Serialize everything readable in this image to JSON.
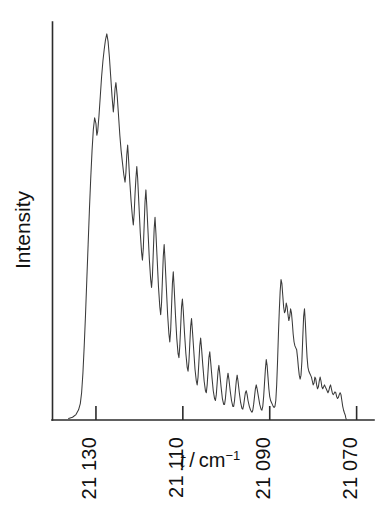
{
  "figure": {
    "background": "#ffffff",
    "trace_color": "#3a3a3a",
    "axis_color": "#2b2b2b"
  },
  "chart_data": {
    "type": "line",
    "title": "",
    "xlabel": "nu-tilde / cm^-1",
    "xlabel_parts": {
      "symbol": "ẽ",
      "separator": " / ",
      "unit": "cm",
      "exponent": "−1"
    },
    "ylabel": "Intensity",
    "xlim": [
      21140.0,
      21066.0
    ],
    "ylim": [
      0,
      100
    ],
    "x_inverted": true,
    "grid": false,
    "legend": null,
    "xticks": [
      21130,
      21110,
      21090,
      21070
    ],
    "xtick_labels": [
      "21 130",
      "21 110",
      "21 090",
      "21 070"
    ],
    "ytick_labels": [],
    "axis_note": "wavenumber decreases to the right; y-axis unlabeled arbitrary intensity",
    "series": [
      {
        "name": "LIF excitation spectrum",
        "color": "#3a3a3a",
        "points": [
          [
            21136.3,
            0.4
          ],
          [
            21135.4,
            0.7
          ],
          [
            21134.6,
            1.4
          ],
          [
            21134.0,
            2.6
          ],
          [
            21133.6,
            4.2
          ],
          [
            21133.3,
            7.0
          ],
          [
            21133.0,
            12.0
          ],
          [
            21132.7,
            19.0
          ],
          [
            21132.4,
            27.0
          ],
          [
            21132.1,
            36.0
          ],
          [
            21131.8,
            45.0
          ],
          [
            21131.5,
            54.0
          ],
          [
            21131.2,
            62.0
          ],
          [
            21130.9,
            69.0
          ],
          [
            21130.6,
            74.5
          ],
          [
            21130.3,
            77.5
          ],
          [
            21130.0,
            76.0
          ],
          [
            21129.8,
            73.0
          ],
          [
            21129.6,
            74.0
          ],
          [
            21129.3,
            78.0
          ],
          [
            21129.0,
            83.0
          ],
          [
            21128.7,
            88.0
          ],
          [
            21128.4,
            92.0
          ],
          [
            21128.1,
            95.0
          ],
          [
            21127.8,
            97.5
          ],
          [
            21127.5,
            99.0
          ],
          [
            21127.2,
            97.0
          ],
          [
            21126.9,
            93.0
          ],
          [
            21126.6,
            88.0
          ],
          [
            21126.3,
            83.0
          ],
          [
            21126.0,
            79.0
          ],
          [
            21125.8,
            81.5
          ],
          [
            21125.6,
            85.0
          ],
          [
            21125.4,
            86.5
          ],
          [
            21125.1,
            83.0
          ],
          [
            21124.8,
            78.0
          ],
          [
            21124.5,
            73.0
          ],
          [
            21124.2,
            69.0
          ],
          [
            21123.9,
            66.0
          ],
          [
            21123.6,
            63.0
          ],
          [
            21123.3,
            61.0
          ],
          [
            21123.1,
            63.5
          ],
          [
            21122.9,
            68.0
          ],
          [
            21122.7,
            70.5
          ],
          [
            21122.5,
            67.0
          ],
          [
            21122.2,
            61.0
          ],
          [
            21121.9,
            56.0
          ],
          [
            21121.6,
            52.0
          ],
          [
            21121.4,
            50.0
          ],
          [
            21121.2,
            53.0
          ],
          [
            21121.0,
            58.0
          ],
          [
            21120.8,
            62.0
          ],
          [
            21120.6,
            65.0
          ],
          [
            21120.4,
            62.0
          ],
          [
            21120.1,
            55.0
          ],
          [
            21119.8,
            48.0
          ],
          [
            21119.5,
            43.0
          ],
          [
            21119.3,
            41.0
          ],
          [
            21119.1,
            44.0
          ],
          [
            21118.9,
            50.0
          ],
          [
            21118.7,
            56.0
          ],
          [
            21118.5,
            59.0
          ],
          [
            21118.3,
            55.0
          ],
          [
            21118.0,
            48.0
          ],
          [
            21117.7,
            41.0
          ],
          [
            21117.4,
            36.0
          ],
          [
            21117.2,
            34.0
          ],
          [
            21117.0,
            37.0
          ],
          [
            21116.8,
            43.0
          ],
          [
            21116.6,
            49.0
          ],
          [
            21116.4,
            52.0
          ],
          [
            21116.2,
            48.0
          ],
          [
            21115.9,
            41.0
          ],
          [
            21115.6,
            34.0
          ],
          [
            21115.3,
            29.0
          ],
          [
            21115.1,
            27.0
          ],
          [
            21114.9,
            30.0
          ],
          [
            21114.7,
            36.0
          ],
          [
            21114.5,
            42.0
          ],
          [
            21114.3,
            45.0
          ],
          [
            21114.1,
            41.0
          ],
          [
            21113.8,
            34.0
          ],
          [
            21113.5,
            27.0
          ],
          [
            21113.2,
            22.0
          ],
          [
            21113.0,
            20.0
          ],
          [
            21112.8,
            23.0
          ],
          [
            21112.6,
            29.0
          ],
          [
            21112.4,
            35.0
          ],
          [
            21112.2,
            38.0
          ],
          [
            21112.0,
            34.0
          ],
          [
            21111.7,
            27.0
          ],
          [
            21111.4,
            21.0
          ],
          [
            21111.1,
            17.0
          ],
          [
            21110.9,
            16.0
          ],
          [
            21110.7,
            19.0
          ],
          [
            21110.5,
            24.0
          ],
          [
            21110.3,
            29.0
          ],
          [
            21110.1,
            31.0
          ],
          [
            21109.9,
            28.0
          ],
          [
            21109.6,
            22.0
          ],
          [
            21109.3,
            17.0
          ],
          [
            21109.0,
            13.5
          ],
          [
            21108.8,
            12.5
          ],
          [
            21108.6,
            15.0
          ],
          [
            21108.4,
            19.5
          ],
          [
            21108.2,
            24.0
          ],
          [
            21108.0,
            26.0
          ],
          [
            21107.8,
            23.0
          ],
          [
            21107.5,
            18.0
          ],
          [
            21107.2,
            13.0
          ],
          [
            21106.9,
            10.0
          ],
          [
            21106.7,
            9.0
          ],
          [
            21106.5,
            11.0
          ],
          [
            21106.3,
            15.0
          ],
          [
            21106.1,
            19.0
          ],
          [
            21105.9,
            21.0
          ],
          [
            21105.7,
            18.5
          ],
          [
            21105.4,
            14.0
          ],
          [
            21105.1,
            10.0
          ],
          [
            21104.8,
            7.5
          ],
          [
            21104.6,
            7.0
          ],
          [
            21104.4,
            9.0
          ],
          [
            21104.2,
            12.5
          ],
          [
            21104.0,
            16.0
          ],
          [
            21103.8,
            17.5
          ],
          [
            21103.6,
            15.0
          ],
          [
            21103.3,
            11.0
          ],
          [
            21103.0,
            7.5
          ],
          [
            21102.7,
            5.5
          ],
          [
            21102.5,
            5.0
          ],
          [
            21102.3,
            6.5
          ],
          [
            21102.1,
            9.5
          ],
          [
            21101.9,
            12.5
          ],
          [
            21101.7,
            14.0
          ],
          [
            21101.5,
            12.0
          ],
          [
            21101.2,
            8.5
          ],
          [
            21100.9,
            5.5
          ],
          [
            21100.6,
            4.0
          ],
          [
            21100.4,
            4.0
          ],
          [
            21100.2,
            5.5
          ],
          [
            21100.0,
            8.0
          ],
          [
            21099.8,
            10.5
          ],
          [
            21099.6,
            12.0
          ],
          [
            21099.4,
            10.5
          ],
          [
            21099.1,
            7.5
          ],
          [
            21098.8,
            5.0
          ],
          [
            21098.5,
            3.5
          ],
          [
            21098.3,
            3.5
          ],
          [
            21098.1,
            5.0
          ],
          [
            21097.9,
            7.5
          ],
          [
            21097.7,
            10.0
          ],
          [
            21097.5,
            11.5
          ],
          [
            21097.3,
            10.0
          ],
          [
            21097.0,
            7.0
          ],
          [
            21096.7,
            4.5
          ],
          [
            21096.4,
            3.0
          ],
          [
            21096.2,
            2.8
          ],
          [
            21096.0,
            3.8
          ],
          [
            21095.8,
            5.5
          ],
          [
            21095.6,
            7.0
          ],
          [
            21095.4,
            7.5
          ],
          [
            21095.2,
            6.5
          ],
          [
            21095.0,
            5.0
          ],
          [
            21094.7,
            3.5
          ],
          [
            21094.4,
            2.5
          ],
          [
            21094.1,
            2.0
          ],
          [
            21093.9,
            2.5
          ],
          [
            21093.7,
            4.0
          ],
          [
            21093.5,
            6.0
          ],
          [
            21093.3,
            8.0
          ],
          [
            21093.1,
            9.0
          ],
          [
            21092.9,
            8.0
          ],
          [
            21092.6,
            6.0
          ],
          [
            21092.3,
            4.0
          ],
          [
            21092.0,
            2.8
          ],
          [
            21091.8,
            2.5
          ],
          [
            21091.6,
            3.5
          ],
          [
            21091.4,
            6.0
          ],
          [
            21091.2,
            9.5
          ],
          [
            21091.0,
            13.0
          ],
          [
            21090.8,
            15.5
          ],
          [
            21090.6,
            14.0
          ],
          [
            21090.4,
            11.0
          ],
          [
            21090.2,
            8.0
          ],
          [
            21090.0,
            6.0
          ],
          [
            21089.8,
            5.0
          ],
          [
            21089.6,
            4.5
          ],
          [
            21089.4,
            4.0
          ],
          [
            21089.2,
            3.5
          ],
          [
            21089.0,
            3.2
          ],
          [
            21088.8,
            3.5
          ],
          [
            21088.6,
            5.0
          ],
          [
            21088.4,
            9.0
          ],
          [
            21088.2,
            15.0
          ],
          [
            21088.0,
            22.0
          ],
          [
            21087.8,
            28.0
          ],
          [
            21087.6,
            33.0
          ],
          [
            21087.4,
            36.0
          ],
          [
            21087.2,
            35.0
          ],
          [
            21087.0,
            32.0
          ],
          [
            21086.8,
            29.0
          ],
          [
            21086.6,
            27.5
          ],
          [
            21086.4,
            28.0
          ],
          [
            21086.2,
            30.0
          ],
          [
            21086.0,
            29.0
          ],
          [
            21085.8,
            27.0
          ],
          [
            21085.6,
            25.5
          ],
          [
            21085.4,
            26.5
          ],
          [
            21085.2,
            28.5
          ],
          [
            21085.0,
            27.5
          ],
          [
            21084.8,
            25.0
          ],
          [
            21084.6,
            22.0
          ],
          [
            21084.4,
            20.0
          ],
          [
            21084.2,
            19.0
          ],
          [
            21084.0,
            18.5
          ],
          [
            21083.8,
            18.0
          ],
          [
            21083.6,
            16.0
          ],
          [
            21083.4,
            13.5
          ],
          [
            21083.2,
            11.5
          ],
          [
            21083.0,
            10.5
          ],
          [
            21082.8,
            11.5
          ],
          [
            21082.6,
            15.0
          ],
          [
            21082.4,
            21.0
          ],
          [
            21082.2,
            26.5
          ],
          [
            21082.0,
            28.5
          ],
          [
            21081.8,
            25.0
          ],
          [
            21081.6,
            20.0
          ],
          [
            21081.4,
            16.0
          ],
          [
            21081.2,
            13.5
          ],
          [
            21081.0,
            12.5
          ],
          [
            21080.8,
            12.0
          ],
          [
            21080.6,
            11.5
          ],
          [
            21080.4,
            11.0
          ],
          [
            21080.2,
            10.0
          ],
          [
            21080.0,
            9.0
          ],
          [
            21079.8,
            9.5
          ],
          [
            21079.6,
            11.0
          ],
          [
            21079.4,
            10.5
          ],
          [
            21079.2,
            9.0
          ],
          [
            21079.0,
            8.0
          ],
          [
            21078.8,
            8.5
          ],
          [
            21078.6,
            10.0
          ],
          [
            21078.4,
            11.0
          ],
          [
            21078.2,
            10.0
          ],
          [
            21078.0,
            8.5
          ],
          [
            21077.8,
            8.0
          ],
          [
            21077.6,
            8.5
          ],
          [
            21077.4,
            9.0
          ],
          [
            21077.2,
            8.5
          ],
          [
            21077.0,
            8.0
          ],
          [
            21076.8,
            7.5
          ],
          [
            21076.6,
            7.0
          ],
          [
            21076.4,
            7.5
          ],
          [
            21076.2,
            8.5
          ],
          [
            21076.0,
            9.0
          ],
          [
            21075.8,
            8.0
          ],
          [
            21075.6,
            7.0
          ],
          [
            21075.4,
            6.5
          ],
          [
            21075.2,
            6.8
          ],
          [
            21075.0,
            7.2
          ],
          [
            21074.8,
            7.0
          ],
          [
            21074.6,
            6.0
          ],
          [
            21074.4,
            5.5
          ],
          [
            21074.2,
            5.8
          ],
          [
            21074.0,
            6.5
          ],
          [
            21073.8,
            7.0
          ],
          [
            21073.6,
            6.5
          ],
          [
            21073.4,
            5.0
          ],
          [
            21073.2,
            3.5
          ],
          [
            21073.0,
            2.5
          ],
          [
            21072.8,
            1.8
          ],
          [
            21072.6,
            1.2
          ],
          [
            21072.5,
            0.6
          ],
          [
            21072.4,
            0.2
          ]
        ]
      }
    ]
  }
}
